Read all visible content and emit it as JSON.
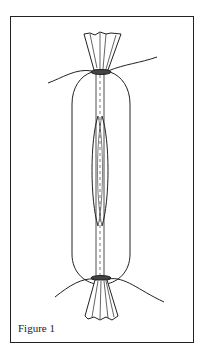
{
  "figure": {
    "caption": "Figure 1",
    "colors": {
      "ink": "#222222",
      "paper": "#ffffff"
    }
  }
}
